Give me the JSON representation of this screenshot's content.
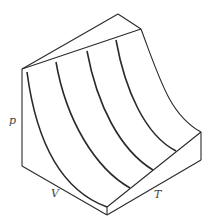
{
  "diagram": {
    "labels": {
      "p": "p",
      "V": "V",
      "T": "T"
    },
    "colors": {
      "line": "#2a2a2a",
      "label": "#444444",
      "background": "#ffffff"
    }
  }
}
